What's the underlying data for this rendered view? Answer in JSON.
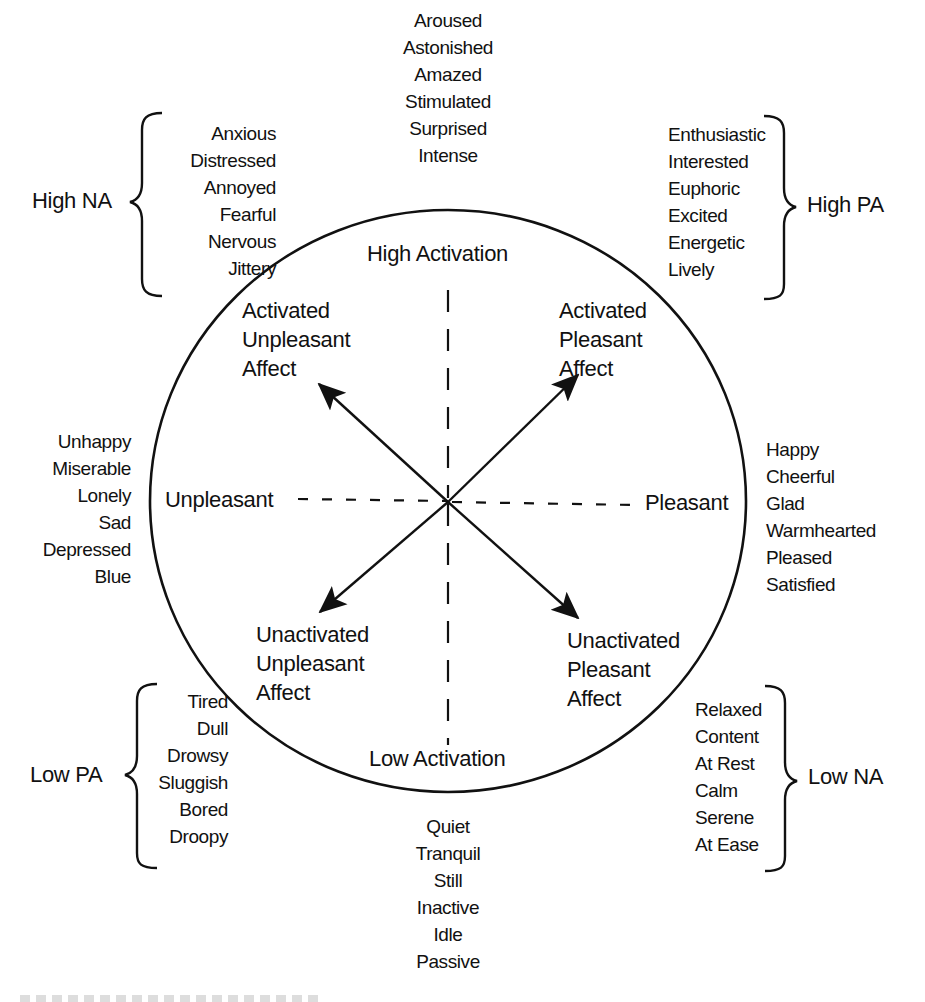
{
  "diagram": {
    "type": "circumplex model of affect",
    "axes": {
      "vertical_top": "High Activation",
      "vertical_bottom": "Low Activation",
      "horizontal_left": "Unpleasant",
      "horizontal_right": "Pleasant"
    },
    "quadrants": {
      "top_left": [
        "Activated",
        "Unpleasant",
        "Affect"
      ],
      "top_right": [
        "Activated",
        "Pleasant",
        "Affect"
      ],
      "bottom_left": [
        "Unactivated",
        "Unpleasant",
        "Affect"
      ],
      "bottom_right": [
        "Unactivated",
        "Pleasant",
        "Affect"
      ]
    },
    "word_groups": {
      "top": [
        "Aroused",
        "Astonished",
        "Amazed",
        "Stimulated",
        "Surprised",
        "Intense"
      ],
      "high_na": {
        "label": "High NA",
        "words": [
          "Anxious",
          "Distressed",
          "Annoyed",
          "Fearful",
          "Nervous",
          "Jittery"
        ]
      },
      "high_pa": {
        "label": "High PA",
        "words": [
          "Enthusiastic",
          "Interested",
          "Euphoric",
          "Excited",
          "Energetic",
          "Lively"
        ]
      },
      "left": [
        "Unhappy",
        "Miserable",
        "Lonely",
        "Sad",
        "Depressed",
        "Blue"
      ],
      "right": [
        "Happy",
        "Cheerful",
        "Glad",
        "Warmhearted",
        "Pleased",
        "Satisfied"
      ],
      "low_pa": {
        "label": "Low PA",
        "words": [
          "Tired",
          "Dull",
          "Drowsy",
          "Sluggish",
          "Bored",
          "Droopy"
        ]
      },
      "low_na": {
        "label": "Low NA",
        "words": [
          "Relaxed",
          "Content",
          "At Rest",
          "Calm",
          "Serene",
          "At Ease"
        ]
      },
      "bottom": [
        "Quiet",
        "Tranquil",
        "Still",
        "Inactive",
        "Idle",
        "Passive"
      ]
    },
    "colors": {
      "ink": "#111111",
      "background": "#ffffff"
    }
  }
}
